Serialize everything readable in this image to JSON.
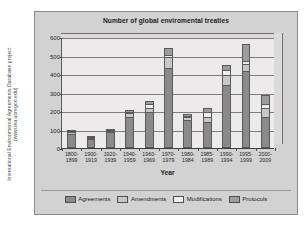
{
  "side_caption": {
    "line1": "International Environmental Agreements Database project",
    "line2": "(www.iea.uoregon.edu)"
  },
  "chart_data": {
    "type": "bar",
    "stacked": true,
    "title": "Number of global enviromental treaties",
    "xlabel": "Year",
    "ylabel": "",
    "ylim": [
      0,
      600
    ],
    "yticks": [
      0,
      100,
      200,
      300,
      400,
      500,
      600
    ],
    "ytick_labels": [
      "0",
      "100",
      "200",
      "300",
      "400",
      "500",
      "600"
    ],
    "grid": true,
    "legend_position": "bottom",
    "categories": [
      "1800-1899",
      "1900-1919",
      "1920-1939",
      "1940-1959",
      "1960-1969",
      "1970-1979",
      "1980-1984",
      "1985-1989",
      "1990-1994",
      "1995-1999",
      "2000-2009"
    ],
    "category_lines": [
      [
        "1800-",
        "1899"
      ],
      [
        "1900-",
        "1919"
      ],
      [
        "1920-",
        "1939"
      ],
      [
        "1940-",
        "1959"
      ],
      [
        "1960-",
        "1969"
      ],
      [
        "1970-",
        "1979"
      ],
      [
        "1980-",
        "1984"
      ],
      [
        "1985-",
        "1989"
      ],
      [
        "1990-",
        "1994"
      ],
      [
        "1995-",
        "1999"
      ],
      [
        "2000-",
        "2009"
      ]
    ],
    "series": [
      {
        "name": "Agreements",
        "color": "#8a8a8a",
        "values": [
          75,
          50,
          85,
          170,
          195,
          430,
          150,
          140,
          340,
          415,
          170
        ]
      },
      {
        "name": "Amendments",
        "color": "#c8c8c8",
        "values": [
          10,
          2,
          3,
          20,
          20,
          60,
          15,
          25,
          55,
          40,
          45
        ]
      },
      {
        "name": "Modifications",
        "color": "#eeeeee",
        "values": [
          5,
          1,
          2,
          5,
          25,
          15,
          10,
          30,
          25,
          15,
          25
        ]
      },
      {
        "name": "Protocols",
        "color": "#9d9d9d",
        "values": [
          5,
          2,
          3,
          10,
          15,
          35,
          10,
          20,
          30,
          95,
          45
        ]
      }
    ],
    "totals": [
      95,
      55,
      93,
      205,
      255,
      540,
      185,
      215,
      450,
      565,
      285
    ]
  }
}
